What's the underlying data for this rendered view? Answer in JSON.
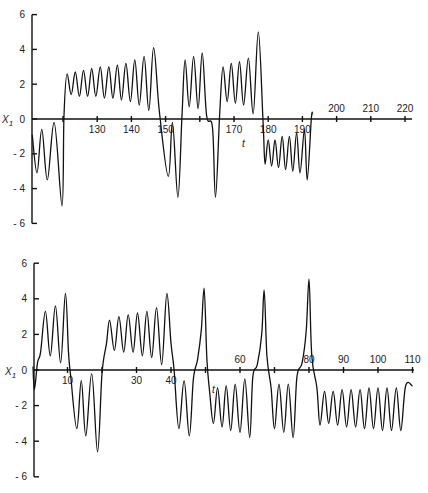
{
  "chart_data": [
    {
      "type": "line",
      "title": "",
      "xlabel": "t",
      "ylabel": "X1",
      "ylim": [
        -6,
        6
      ],
      "xlim": [
        111,
        222
      ],
      "yticks": [
        6,
        4,
        2,
        0,
        -2,
        -4,
        -6
      ],
      "xticks": [
        120,
        130,
        140,
        150,
        160,
        170,
        180,
        190,
        200,
        210,
        220
      ],
      "xtick_labels": [
        "130",
        "140",
        "150",
        "170",
        "180",
        "190",
        "200",
        "210",
        "220"
      ],
      "grid": false,
      "legend": null,
      "series": [
        {
          "name": "X1(t)",
          "points": [
            [
              111.0,
              -0.9
            ],
            [
              112.4,
              -3.1
            ],
            [
              113.8,
              -0.6
            ],
            [
              115.4,
              -3.5
            ],
            [
              117.4,
              -0.2
            ],
            [
              119.7,
              -5.0
            ],
            [
              120.3,
              0.2
            ],
            [
              121.2,
              2.6
            ],
            [
              122.4,
              1.4
            ],
            [
              123.6,
              2.7
            ],
            [
              124.8,
              1.3
            ],
            [
              126.0,
              2.8
            ],
            [
              127.2,
              1.3
            ],
            [
              128.4,
              2.9
            ],
            [
              129.6,
              1.3
            ],
            [
              130.9,
              3.0
            ],
            [
              132.1,
              1.2
            ],
            [
              133.4,
              3.0
            ],
            [
              134.6,
              1.2
            ],
            [
              135.9,
              3.1
            ],
            [
              137.1,
              1.1
            ],
            [
              138.4,
              3.2
            ],
            [
              139.7,
              1.0
            ],
            [
              141.0,
              3.4
            ],
            [
              142.3,
              0.8
            ],
            [
              143.7,
              3.6
            ],
            [
              145.1,
              0.5
            ],
            [
              146.5,
              4.1
            ],
            [
              148.2,
              0.4
            ],
            [
              150.8,
              -3.3
            ],
            [
              152.0,
              -0.2
            ],
            [
              153.6,
              -4.5
            ],
            [
              154.8,
              0.2
            ],
            [
              155.7,
              3.4
            ],
            [
              156.9,
              0.7
            ],
            [
              158.2,
              3.6
            ],
            [
              159.5,
              0.6
            ],
            [
              160.7,
              3.8
            ],
            [
              162.0,
              0.2
            ],
            [
              163.7,
              -0.5
            ],
            [
              164.6,
              -4.5
            ],
            [
              165.8,
              0.2
            ],
            [
              166.8,
              3.0
            ],
            [
              168.0,
              1.0
            ],
            [
              169.2,
              3.2
            ],
            [
              170.4,
              0.9
            ],
            [
              171.6,
              3.3
            ],
            [
              172.8,
              0.8
            ],
            [
              174.2,
              3.5
            ],
            [
              175.6,
              0.3
            ],
            [
              177.1,
              5.0
            ],
            [
              178.5,
              -0.2
            ],
            [
              179.1,
              -2.6
            ],
            [
              180.0,
              -1.2
            ],
            [
              181.0,
              -2.7
            ],
            [
              182.0,
              -1.2
            ],
            [
              183.0,
              -2.8
            ],
            [
              184.1,
              -1.0
            ],
            [
              185.1,
              -2.9
            ],
            [
              186.2,
              -1.0
            ],
            [
              187.2,
              -3.0
            ],
            [
              188.3,
              -0.8
            ],
            [
              189.3,
              -3.1
            ],
            [
              190.6,
              -0.6
            ],
            [
              191.4,
              -3.5
            ],
            [
              192.6,
              0.0
            ],
            [
              193.0,
              0.3
            ]
          ]
        }
      ]
    },
    {
      "type": "line",
      "title": "",
      "xlabel": "t",
      "ylabel": "X1",
      "ylim": [
        -6,
        6
      ],
      "xlim": [
        0,
        110
      ],
      "yticks": [
        6,
        4,
        2,
        0,
        -2,
        -4,
        -6
      ],
      "xticks": [
        10,
        20,
        30,
        40,
        50,
        60,
        70,
        80,
        90,
        100,
        110
      ],
      "xtick_labels": [
        "10",
        "30",
        "40",
        "60",
        "80",
        "90",
        "100",
        "110"
      ],
      "grid": false,
      "legend": null,
      "series": [
        {
          "name": "X1(t)",
          "points": [
            [
              0.0,
              0.2
            ],
            [
              0.4,
              -1.1
            ],
            [
              1.3,
              0.4
            ],
            [
              2.2,
              1.0
            ],
            [
              3.6,
              3.3
            ],
            [
              5.0,
              0.8
            ],
            [
              6.5,
              3.6
            ],
            [
              8.0,
              0.4
            ],
            [
              9.4,
              4.3
            ],
            [
              10.3,
              1.0
            ],
            [
              11.0,
              -0.5
            ],
            [
              12.7,
              -3.3
            ],
            [
              14.0,
              -0.6
            ],
            [
              15.3,
              -3.7
            ],
            [
              17.0,
              -0.2
            ],
            [
              18.7,
              -4.6
            ],
            [
              20.0,
              -0.2
            ],
            [
              21.3,
              1.5
            ],
            [
              22.2,
              2.8
            ],
            [
              23.6,
              1.1
            ],
            [
              24.9,
              3.0
            ],
            [
              26.3,
              1.0
            ],
            [
              27.6,
              3.1
            ],
            [
              29.0,
              1.0
            ],
            [
              30.3,
              3.2
            ],
            [
              31.7,
              0.8
            ],
            [
              33.0,
              3.3
            ],
            [
              34.4,
              0.7
            ],
            [
              35.8,
              3.5
            ],
            [
              37.3,
              0.3
            ],
            [
              38.8,
              4.3
            ],
            [
              40.0,
              1.5
            ],
            [
              40.9,
              0.0
            ],
            [
              42.3,
              -3.3
            ],
            [
              43.8,
              -0.6
            ],
            [
              45.3,
              -3.7
            ],
            [
              46.5,
              -0.5
            ],
            [
              47.7,
              0.6
            ],
            [
              48.8,
              2.3
            ],
            [
              49.6,
              4.6
            ],
            [
              50.4,
              0.6
            ],
            [
              51.2,
              -1.2
            ],
            [
              52.3,
              -3.0
            ],
            [
              53.5,
              -1.0
            ],
            [
              54.8,
              -3.2
            ],
            [
              56.0,
              -0.9
            ],
            [
              57.3,
              -3.4
            ],
            [
              58.6,
              -0.8
            ],
            [
              60.0,
              -3.5
            ],
            [
              61.4,
              -0.5
            ],
            [
              62.8,
              -3.8
            ],
            [
              63.7,
              -0.4
            ],
            [
              65.0,
              0.3
            ],
            [
              66.3,
              2.0
            ],
            [
              67.0,
              4.5
            ],
            [
              67.8,
              0.8
            ],
            [
              69.0,
              -1.0
            ],
            [
              70.0,
              -3.3
            ],
            [
              71.3,
              -0.8
            ],
            [
              72.7,
              -3.5
            ],
            [
              74.0,
              -0.8
            ],
            [
              75.4,
              -3.8
            ],
            [
              76.5,
              -0.4
            ],
            [
              78.0,
              0.4
            ],
            [
              79.2,
              2.2
            ],
            [
              80.0,
              5.1
            ],
            [
              80.8,
              0.8
            ],
            [
              82.3,
              -1.0
            ],
            [
              83.2,
              -3.1
            ],
            [
              84.5,
              -1.2
            ],
            [
              85.7,
              -3.0
            ],
            [
              87.0,
              -1.2
            ],
            [
              88.3,
              -3.1
            ],
            [
              89.6,
              -1.1
            ],
            [
              90.9,
              -3.2
            ],
            [
              92.2,
              -1.1
            ],
            [
              93.5,
              -3.2
            ],
            [
              94.8,
              -1.1
            ],
            [
              96.1,
              -3.3
            ],
            [
              97.4,
              -1.0
            ],
            [
              98.7,
              -3.3
            ],
            [
              100.0,
              -1.0
            ],
            [
              101.3,
              -3.4
            ],
            [
              102.6,
              -1.0
            ],
            [
              103.9,
              -3.4
            ],
            [
              105.3,
              -1.0
            ],
            [
              106.6,
              -3.4
            ],
            [
              108.0,
              -0.9
            ],
            [
              110.0,
              -0.9
            ]
          ]
        }
      ]
    }
  ],
  "labels": {
    "y_axis_title": "X1",
    "x_axis_title": "t"
  }
}
